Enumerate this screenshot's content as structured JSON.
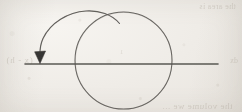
{
  "figure": {
    "name": "circle-rotated-about-axis",
    "ink_color": "#55534f",
    "paper_color": "#f2f0ec",
    "elements": {
      "axis_line_label": "horizontal axis",
      "circle_label": "circle",
      "arrow_label": "rotation arrow"
    },
    "geometry": {
      "circle": {
        "cx": 123.5,
        "cy": 60.5,
        "r": 48.5
      },
      "axis": {
        "x1": 25,
        "y1": 64,
        "x2": 218,
        "y2": 64
      },
      "arrow_start": {
        "x": 118,
        "y": 22
      },
      "arrow_apex": {
        "x": 86,
        "y": 11
      },
      "arrow_tip": {
        "x": 40,
        "y": 63
      }
    }
  },
  "showthrough": {
    "top_right": "the area is",
    "middle_left": "(x - h)",
    "middle_right": "dx",
    "bottom_right": "the volume we ...",
    "fraction": "1"
  }
}
